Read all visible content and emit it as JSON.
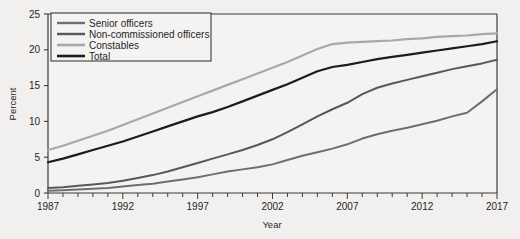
{
  "figure": {
    "background_color": "#f1f0ee",
    "plot_background_color": "#f4f3f1",
    "axis_color": "#3b3b3b"
  },
  "chart_data": {
    "type": "line",
    "title": "",
    "xlabel": "Year",
    "ylabel": "Percent",
    "xlim": [
      1987,
      2017
    ],
    "ylim": [
      0,
      25
    ],
    "xticks": [
      1987,
      1988,
      1989,
      1990,
      1991,
      1992,
      1993,
      1994,
      1995,
      1996,
      1997,
      1998,
      1999,
      2000,
      2001,
      2002,
      2003,
      2004,
      2005,
      2006,
      2007,
      2008,
      2009,
      2010,
      2011,
      2012,
      2013,
      2014,
      2015,
      2016,
      2017
    ],
    "xtick_labels": [
      "1987",
      "",
      "",
      "",
      "",
      "1992",
      "",
      "",
      "",
      "",
      "1997",
      "",
      "",
      "",
      "",
      "2002",
      "",
      "",
      "",
      "",
      "2007",
      "",
      "",
      "",
      "",
      "2012",
      "",
      "",
      "",
      "",
      "2017"
    ],
    "xtick_major_labels": [
      "1987",
      "1992",
      "1997",
      "2002",
      "2007",
      "2012",
      "2017"
    ],
    "yticks": [
      0,
      5,
      10,
      15,
      20,
      25
    ],
    "ytick_labels": [
      "0",
      "5",
      "10",
      "15",
      "20",
      "25"
    ],
    "grid": false,
    "legend_position": "upper left",
    "x": [
      1987,
      1988,
      1989,
      1990,
      1991,
      1992,
      1993,
      1994,
      1995,
      1996,
      1997,
      1998,
      1999,
      2000,
      2001,
      2002,
      2003,
      2004,
      2005,
      2006,
      2007,
      2008,
      2009,
      2010,
      2011,
      2012,
      2013,
      2014,
      2015,
      2016,
      2017
    ],
    "series": [
      {
        "name": "Senior officers",
        "color": "#6e6e6e",
        "width": 2.0,
        "values": [
          0.3,
          0.4,
          0.5,
          0.6,
          0.7,
          0.9,
          1.1,
          1.3,
          1.6,
          1.9,
          2.2,
          2.6,
          3.0,
          3.3,
          3.6,
          4.0,
          4.6,
          5.2,
          5.7,
          6.2,
          6.8,
          7.6,
          8.2,
          8.7,
          9.1,
          9.6,
          10.1,
          10.7,
          11.2,
          12.8,
          14.5
        ]
      },
      {
        "name": "Non-commissioned officers",
        "color": "#585858",
        "width": 2.0,
        "values": [
          0.7,
          0.8,
          1.0,
          1.2,
          1.4,
          1.7,
          2.1,
          2.5,
          3.0,
          3.6,
          4.2,
          4.8,
          5.4,
          6.0,
          6.7,
          7.5,
          8.5,
          9.6,
          10.7,
          11.7,
          12.6,
          13.8,
          14.7,
          15.3,
          15.8,
          16.3,
          16.8,
          17.3,
          17.7,
          18.1,
          18.6
        ]
      },
      {
        "name": "Constables",
        "color": "#a8a8a8",
        "width": 2.2,
        "values": [
          6.0,
          6.6,
          7.3,
          8.0,
          8.7,
          9.5,
          10.3,
          11.1,
          11.9,
          12.7,
          13.5,
          14.3,
          15.1,
          15.9,
          16.7,
          17.5,
          18.3,
          19.2,
          20.1,
          20.8,
          21.0,
          21.1,
          21.2,
          21.3,
          21.5,
          21.6,
          21.8,
          21.9,
          22.0,
          22.2,
          22.3
        ]
      },
      {
        "name": "Total",
        "color": "#1c1c1c",
        "width": 2.2,
        "values": [
          4.3,
          4.8,
          5.4,
          6.0,
          6.6,
          7.2,
          7.9,
          8.6,
          9.3,
          10.0,
          10.7,
          11.3,
          12.0,
          12.8,
          13.6,
          14.4,
          15.2,
          16.1,
          17.0,
          17.6,
          17.9,
          18.3,
          18.7,
          19.0,
          19.3,
          19.6,
          19.9,
          20.2,
          20.5,
          20.8,
          21.2
        ]
      }
    ]
  },
  "legend": {
    "entries": [
      {
        "label": "Senior officers"
      },
      {
        "label": "Non-commissioned officers"
      },
      {
        "label": "Constables"
      },
      {
        "label": "Total"
      }
    ]
  }
}
